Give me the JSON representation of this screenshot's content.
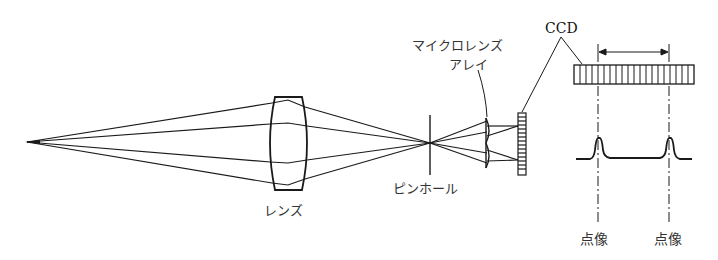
{
  "diagram": {
    "type": "optical-setup",
    "labels": {
      "lens": "レンズ",
      "pinhole": "ピンホール",
      "microlens_array_line1": "マイクロレンズ",
      "microlens_array_line2": "アレイ",
      "ccd": "CCD",
      "point_image_left": "点像",
      "point_image_right": "点像"
    },
    "colors": {
      "stroke": "#1a1a1a",
      "text": "#333333",
      "background": "#ffffff"
    }
  }
}
